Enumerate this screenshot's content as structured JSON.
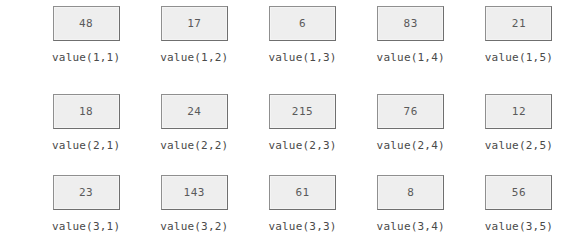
{
  "grid": {
    "rows": 3,
    "columns": 5,
    "box_fill_color": "#eeeeee",
    "box_border_color": "#8a8a8a",
    "text_color": "#5a5a5a",
    "label_color": "#4a4a4a",
    "background_color": "#ffffff",
    "cells": [
      [
        {
          "value": "48",
          "label": "value(1,1)"
        },
        {
          "value": "17",
          "label": "value(1,2)"
        },
        {
          "value": "6",
          "label": "value(1,3)"
        },
        {
          "value": "83",
          "label": "value(1,4)"
        },
        {
          "value": "21",
          "label": "value(1,5)"
        }
      ],
      [
        {
          "value": "18",
          "label": "value(2,1)"
        },
        {
          "value": "24",
          "label": "value(2,2)"
        },
        {
          "value": "215",
          "label": "value(2,3)"
        },
        {
          "value": "76",
          "label": "value(2,4)"
        },
        {
          "value": "12",
          "label": "value(2,5)"
        }
      ],
      [
        {
          "value": "23",
          "label": "value(3,1)"
        },
        {
          "value": "143",
          "label": "value(3,2)"
        },
        {
          "value": "61",
          "label": "value(3,3)"
        },
        {
          "value": "8",
          "label": "value(3,4)"
        },
        {
          "value": "56",
          "label": "value(3,5)"
        }
      ]
    ]
  }
}
